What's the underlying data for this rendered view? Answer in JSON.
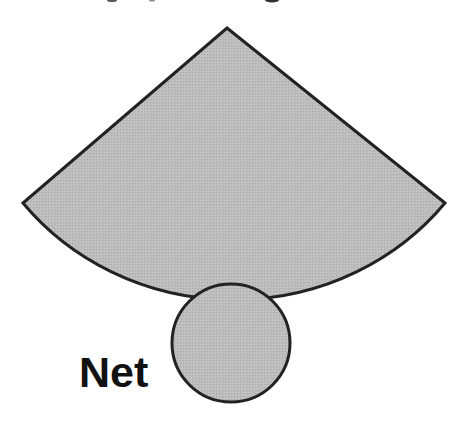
{
  "diagram": {
    "label": "Net",
    "colors": {
      "fill": "#b9b9b9",
      "stroke": "#222222",
      "background": "#ffffff",
      "text": "#111111"
    },
    "sector": {
      "apex": [
        227,
        28
      ],
      "left_corner": [
        23,
        203
      ],
      "right_corner": [
        445,
        203
      ],
      "arc_bottom_y": 283
    },
    "base_circle": {
      "center": [
        231,
        343
      ],
      "radius": 59
    }
  }
}
